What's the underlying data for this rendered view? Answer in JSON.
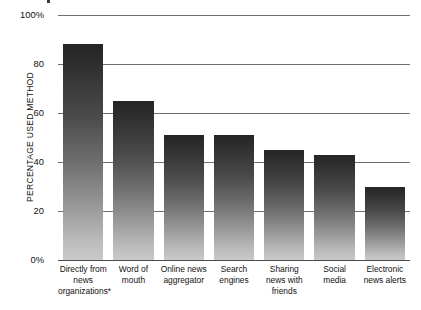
{
  "chart_data": {
    "type": "bar",
    "title": "",
    "subtitle": "",
    "xlabel": "",
    "ylabel": "PERCENTAGE USED METHOD",
    "ylim": [
      0,
      100
    ],
    "grid": true,
    "legend": null,
    "orientation": "vertical",
    "categories": [
      "Directly from news organizations*",
      "Word of mouth",
      "Online news aggregator",
      "Search engines",
      "Sharing news with friends",
      "Social media",
      "Electronic news alerts"
    ],
    "category_lines": [
      [
        "Directly from",
        "news",
        "organizations*"
      ],
      [
        "Word of",
        "mouth"
      ],
      [
        "Online news",
        "aggregator"
      ],
      [
        "Search",
        "engines"
      ],
      [
        "Sharing",
        "news with",
        "friends"
      ],
      [
        "Social",
        "media"
      ],
      [
        "Electronic",
        "news alerts"
      ]
    ],
    "values": [
      88,
      65,
      51,
      51,
      45,
      43,
      30
    ],
    "ytick_labels": [
      "100%",
      "80",
      "60",
      "40",
      "20",
      "0%"
    ],
    "ytick_values": [
      100,
      80,
      60,
      40,
      20,
      0
    ],
    "bar_color_top": "#252525",
    "bar_color_bottom": "#c9c9c9",
    "gridline_color": "#6f6f6f",
    "axis_color": "#4a4a4a",
    "text_color": "#111111",
    "background_color": "#ffffff",
    "footnote_marker": "*"
  }
}
